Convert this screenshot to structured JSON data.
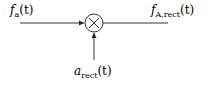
{
  "diagram": {
    "type": "multiplier-block",
    "input": {
      "symbol": "f",
      "subscript": "a",
      "arg": "(t)",
      "label": "f_a(t)"
    },
    "output": {
      "symbol": "f",
      "subscript": "A,rect",
      "arg": "(t)",
      "label": "f_A,rect(t)"
    },
    "modulator": {
      "symbol": "a",
      "subscript": "rect",
      "arg": "(t)",
      "label": "a_rect(t)"
    },
    "operator": "×"
  }
}
